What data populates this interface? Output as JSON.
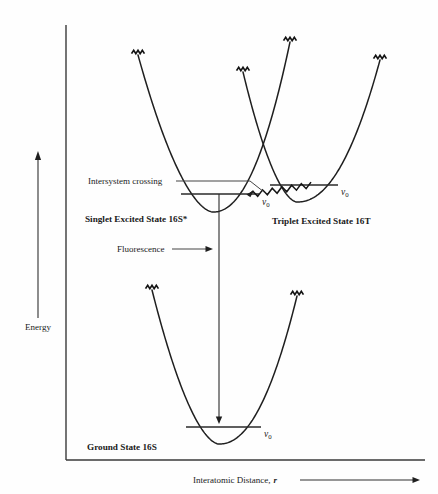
{
  "figure": {
    "background_color": "#fefefe",
    "curve_color": "#1f1f1f",
    "axis_color": "#3a3a3a",
    "text_color": "#1a1a1a"
  },
  "axes": {
    "y_label": "Energy",
    "x_label_main": "Interatomic Distance,",
    "x_label_symbol": "r",
    "y_axis": {
      "x": 66,
      "y_top": 25,
      "y_bottom": 460
    },
    "x_axis": {
      "y": 460,
      "x_left": 66,
      "x_right": 425
    },
    "energy_arrow": {
      "x": 38,
      "y_top": 152,
      "y_bottom": 318
    },
    "energy_label_pos": {
      "x": 38,
      "y": 330
    },
    "x_label_pos": {
      "x": 193,
      "y": 483
    },
    "x_arrow": {
      "x_start": 300,
      "x_end": 420,
      "y": 480
    }
  },
  "states": [
    {
      "id": "singlet-excited",
      "label": "Singlet Excited State 16S*",
      "label_pos": {
        "x": 85,
        "y": 222
      },
      "vertex": {
        "x": 213,
        "y": 212
      },
      "left_arm_x": 138,
      "right_arm_x": 290,
      "left_top_y": 55,
      "right_top_y": 42,
      "v0": {
        "label_text": "v",
        "subscript": "0",
        "line_x_start": 181,
        "line_x_end": 259,
        "line_y": 194,
        "label_pos": {
          "x": 262,
          "y": 205
        }
      }
    },
    {
      "id": "triplet-excited",
      "label": "Triplet Excited State 16T",
      "label_pos": {
        "x": 272,
        "y": 224
      },
      "vertex": {
        "x": 297,
        "y": 202
      },
      "left_arm_x": 243,
      "right_arm_x": 380,
      "left_top_y": 72,
      "right_top_y": 60,
      "v0": {
        "label_text": "v",
        "subscript": "0",
        "line_x_start": 270,
        "line_x_end": 338,
        "line_y": 185,
        "label_pos": {
          "x": 341,
          "y": 195
        }
      }
    },
    {
      "id": "ground",
      "label": "Ground State 16S",
      "label_pos": {
        "x": 87,
        "y": 450
      },
      "vertex": {
        "x": 219,
        "y": 444
      },
      "left_arm_x": 152,
      "right_arm_x": 297,
      "left_top_y": 290,
      "right_top_y": 296,
      "v0": {
        "label_text": "v",
        "subscript": "0",
        "line_x_start": 186,
        "line_x_end": 261,
        "line_y": 427,
        "label_pos": {
          "x": 264,
          "y": 437
        }
      }
    }
  ],
  "annotations": [
    {
      "id": "intersystem-crossing",
      "label": "Intersystem crossing",
      "label_pos": {
        "x": 88,
        "y": 184
      },
      "leader": {
        "x_start": 176,
        "y_start": 181,
        "x_mid": 250,
        "y_mid": 181,
        "x_end": 264,
        "y_end": 192
      }
    },
    {
      "id": "fluorescence",
      "label": "Fluorescence",
      "label_pos": {
        "x": 117,
        "y": 252
      },
      "leader": {
        "x_start": 172,
        "y_start": 249,
        "x_end": 213,
        "y_end": 249
      }
    }
  ],
  "transitions": [
    {
      "id": "fluorescence-transition",
      "type": "straight-arrow-down",
      "x": 219,
      "y_start": 194,
      "y_end": 424
    },
    {
      "id": "isc-transition",
      "type": "squiggle-arrow-right",
      "x_start": 248,
      "y_start": 195,
      "x_end": 311,
      "y_end": 185
    }
  ],
  "continuum_marks": {
    "description": "zigzag squiggle tips at the open ends of each potential curve",
    "count": 6,
    "icon_name": "zigzag-squiggle"
  }
}
